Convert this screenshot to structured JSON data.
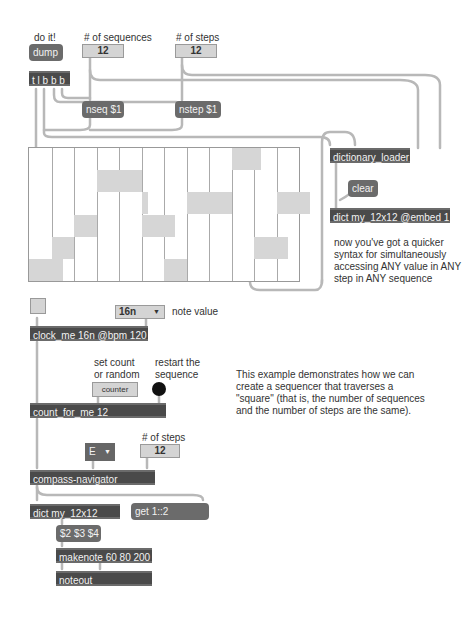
{
  "labels": {
    "do_it": "do it!",
    "num_sequences": "# of sequences",
    "num_steps": "# of steps",
    "note_value": "note value",
    "set_count": "set count",
    "or_random": "or random",
    "restart_1": "restart the",
    "restart_2": "sequence",
    "num_steps_2": "# of steps"
  },
  "messages": {
    "dump": "dump",
    "nseq": "nseq $1",
    "nstep": "nstep $1",
    "clear": "clear",
    "get": "get 1::2",
    "dollar": "$2 $3 $4"
  },
  "objects": {
    "trigger": "t l b b b",
    "dictionary_loader": "dictionary_loader",
    "dict_embed": "dict my_12x12 @embed 1",
    "clock": "clock_me 16n @bpm 120",
    "count": "count_for_me 12",
    "compass": "compass-navigator",
    "dict": "dict my_12x12",
    "makenote": "makenote 60 80 200",
    "noteout": "noteout"
  },
  "numbers": {
    "sequences": "12",
    "steps": "12",
    "steps_2": "12"
  },
  "menus": {
    "note_value": "16n",
    "direction": "E"
  },
  "buttons": {
    "counter": "counter"
  },
  "comments": {
    "quicker_syntax": "now you've got a quicker syntax for simultaneously accessing ANY value in ANY step in ANY sequence",
    "description": "This example demonstrates how we can create a sequencer that traverses a \"square\" (that is, the number of sequences and the number of steps are the same)."
  },
  "multislider": {
    "columns": 12,
    "rows": 6,
    "values_row_from_top": [
      5,
      4,
      3,
      1,
      1,
      3,
      5,
      2,
      2,
      0,
      4,
      2
    ],
    "partial_bars": [
      {
        "col": 0,
        "row": 5,
        "frac": 0.5
      },
      {
        "col": 5,
        "row": 3,
        "frac": 0.5
      },
      {
        "col": 4,
        "row": 2,
        "frac": 0.3
      },
      {
        "col": 9,
        "row": 0,
        "frac": 0.3
      },
      {
        "col": 10,
        "row": 4,
        "frac": 0.5
      },
      {
        "col": 11,
        "row": 2,
        "frac": 0.5
      }
    ]
  },
  "colors": {
    "object_bg": "#4a4a4a",
    "message_bg": "#6b6b6b",
    "number_bg": "#d4d4d4",
    "cord": "#b4b4b4",
    "bar": "#d6d6d6"
  }
}
